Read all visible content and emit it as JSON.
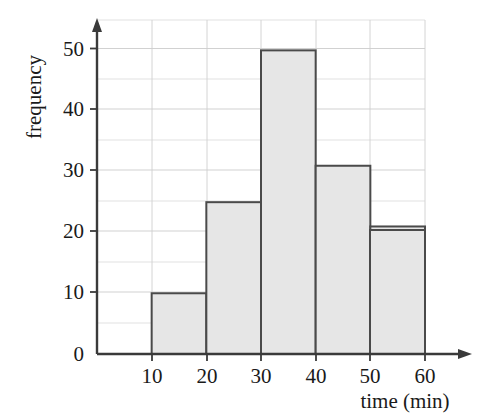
{
  "chart_data": {
    "type": "bar",
    "title": "",
    "subtitle": "",
    "xlabel": "time (min)",
    "ylabel": "frequency",
    "categories": [
      "0-10",
      "10-20",
      "20-30",
      "30-40",
      "40-50",
      "50-60"
    ],
    "bin_edges": [
      0,
      10,
      20,
      30,
      40,
      50,
      60
    ],
    "values": [
      15,
      10,
      25,
      50,
      31,
      21
    ],
    "xlim": [
      0,
      60
    ],
    "ylim": [
      0,
      55
    ],
    "xticks": [
      10,
      20,
      30,
      40,
      50,
      60
    ],
    "xtick_labels": [
      "10",
      "20",
      "30",
      "40",
      "50",
      "60"
    ],
    "yticks": [
      0,
      10,
      20,
      30,
      40,
      50
    ],
    "ytick_labels": [
      "0",
      "10",
      "20",
      "30",
      "40",
      "50"
    ],
    "y_minor_ticks": [
      5,
      15,
      25,
      35,
      45,
      55
    ],
    "grid": true,
    "grid_color": "#d4d4d4",
    "legend": "none",
    "bar_fill_color": "#e6e6e6",
    "bar_edge_color": "#4a4a4a",
    "axis_color": "#3a3a3a"
  },
  "axes": {
    "y_axis_label": "frequency",
    "x_axis_label": "time (min)",
    "y_tick_0": "0",
    "y_tick_10": "10",
    "y_tick_20": "20",
    "y_tick_30": "30",
    "y_tick_40": "40",
    "y_tick_50": "50",
    "x_tick_10": "10",
    "x_tick_20": "20",
    "x_tick_30": "30",
    "x_tick_40": "40",
    "x_tick_50": "50",
    "x_tick_60": "60"
  }
}
